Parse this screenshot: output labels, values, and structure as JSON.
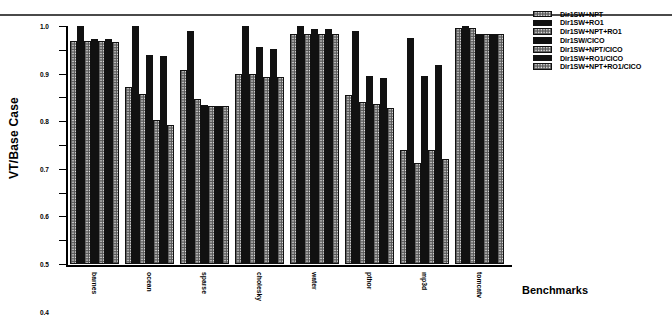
{
  "figure": {
    "y_axis_title": "VT/Base Case",
    "x_axis_title": "Benchmarks"
  },
  "legend": {
    "items": [
      {
        "label": "Dir1SW+NPT",
        "pattern": "stipple"
      },
      {
        "label": "Dir1SW+RO1",
        "pattern": "solid"
      },
      {
        "label": "Dir1SW+NPT+RO1",
        "pattern": "stipple"
      },
      {
        "label": "Dir1SW/CICO",
        "pattern": "solid"
      },
      {
        "label": "Dir1SW+NPT/CICO",
        "pattern": "stipple"
      },
      {
        "label": "Dir1SW+RO1/CICO",
        "pattern": "solid"
      },
      {
        "label": "Dir1SW+NPT+RO1/CICO",
        "pattern": "stipple"
      }
    ]
  },
  "chart_data": {
    "type": "bar",
    "title": "",
    "xlabel": "Benchmarks",
    "ylabel": "VT/Base Case",
    "ylim": [
      0.0,
      1.0
    ],
    "yticks": [
      "0.0",
      "0.1",
      "0.2",
      "0.3",
      "0.4",
      "0.5",
      "0.6",
      "0.7",
      "0.8",
      "0.9",
      "1.0"
    ],
    "grid": false,
    "legend_position": "right",
    "categories": [
      "barnes",
      "ocean",
      "sparse",
      "cholesky",
      "water",
      "pthor",
      "mp3d",
      "tomcatv"
    ],
    "series": [
      {
        "name": "Dir1SW+NPT",
        "pattern": "stipple",
        "values": [
          0.935,
          0.742,
          0.815,
          0.797,
          0.965,
          0.71,
          0.477,
          0.992
        ]
      },
      {
        "name": "Dir1SW+RO1",
        "pattern": "solid",
        "values": [
          1.0,
          1.0,
          0.978,
          1.0,
          1.0,
          0.977,
          0.95,
          1.0
        ]
      },
      {
        "name": "Dir1SW+NPT+RO1",
        "pattern": "stipple",
        "values": [
          0.935,
          0.715,
          0.693,
          0.797,
          0.965,
          0.68,
          0.425,
          0.992
        ]
      },
      {
        "name": "Dir1SW/CICO",
        "pattern": "solid",
        "values": [
          0.945,
          0.878,
          0.667,
          0.912,
          0.987,
          0.79,
          0.79,
          0.968
        ]
      },
      {
        "name": "Dir1SW+NPT/CICO",
        "pattern": "stipple",
        "values": [
          0.935,
          0.607,
          0.665,
          0.787,
          0.965,
          0.673,
          0.477,
          0.968
        ]
      },
      {
        "name": "Dir1SW+RO1/CICO",
        "pattern": "solid",
        "values": [
          0.945,
          0.875,
          0.666,
          0.905,
          0.987,
          0.782,
          0.838,
          0.968
        ]
      },
      {
        "name": "Dir1SW+NPT+RO1/CICO",
        "pattern": "stipple",
        "values": [
          0.932,
          0.585,
          0.665,
          0.787,
          0.965,
          0.655,
          0.443,
          0.968
        ]
      }
    ]
  }
}
